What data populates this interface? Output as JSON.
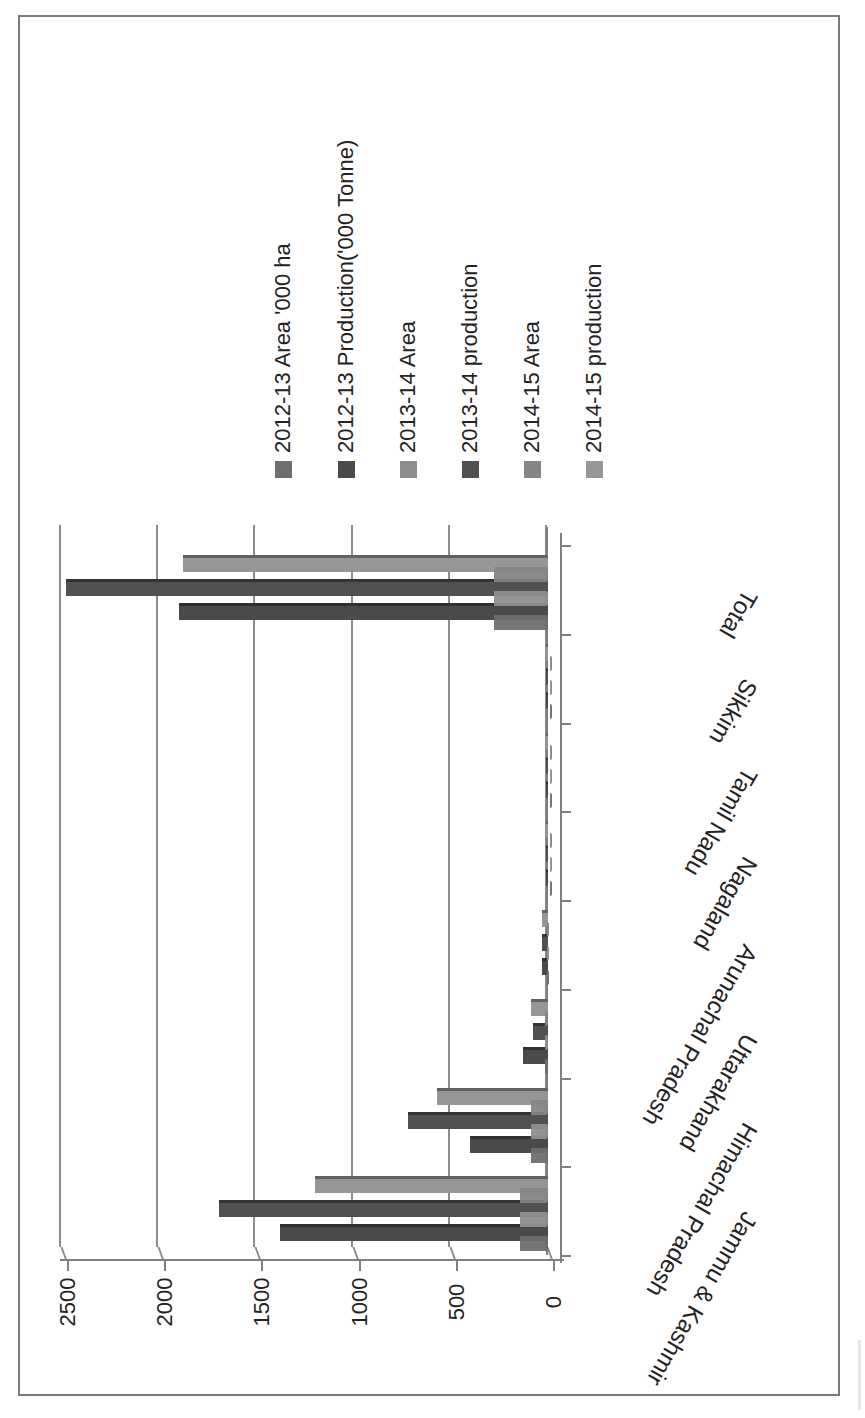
{
  "chart_data": {
    "type": "bar",
    "orientation": "3D clustered column, page rotated 90° clockwise (value axis runs horizontally)",
    "title": "",
    "xlabel": "",
    "ylabel": "",
    "ylim": [
      0,
      2500
    ],
    "yticks": [
      0,
      500,
      1000,
      1500,
      2000,
      2500
    ],
    "grid": true,
    "legend_position": "right (rotated, top of page)",
    "categories": [
      "Jammu & Kashmir",
      "Himachal Pradesh",
      "Uttarakhand",
      "Arunachal Pradesh",
      "Nagaland",
      "Tamil Nadu",
      "Sikkim",
      "Total"
    ],
    "series": [
      {
        "name": "2012-13 Area '000 ha",
        "color": "#6e6e6e",
        "values": [
          165,
          110,
          35,
          25,
          5,
          3,
          2,
          300
        ]
      },
      {
        "name": "2012-13 Production('000 Tonne)",
        "color": "#4a4a4a",
        "values": [
          1380,
          400,
          130,
          30,
          5,
          3,
          2,
          1900
        ]
      },
      {
        "name": "2013-14 Area",
        "color": "#8e8e8e",
        "values": [
          165,
          110,
          35,
          25,
          5,
          3,
          2,
          300
        ]
      },
      {
        "name": "2013-14 production",
        "color": "#505050",
        "values": [
          1690,
          720,
          75,
          30,
          5,
          3,
          2,
          2480
        ]
      },
      {
        "name": "2014-15 Area",
        "color": "#858585",
        "values": [
          165,
          110,
          35,
          25,
          5,
          3,
          2,
          300
        ]
      },
      {
        "name": "2014-15 production",
        "color": "#969696",
        "values": [
          1200,
          570,
          90,
          30,
          5,
          3,
          2,
          1880
        ]
      }
    ]
  },
  "axis": {
    "tick_labels": [
      "0",
      "500",
      "1000",
      "1500",
      "2000",
      "2500"
    ]
  },
  "legend": {
    "items": [
      {
        "label": "2012-13 Area '000 ha",
        "color": "#6e6e6e"
      },
      {
        "label": "2012-13 Production('000 Tonne)",
        "color": "#4a4a4a"
      },
      {
        "label": "2013-14 Area",
        "color": "#8e8e8e"
      },
      {
        "label": "2013-14 production",
        "color": "#505050"
      },
      {
        "label": "2014-15 Area",
        "color": "#858585"
      },
      {
        "label": "2014-15 production",
        "color": "#969696"
      }
    ]
  }
}
